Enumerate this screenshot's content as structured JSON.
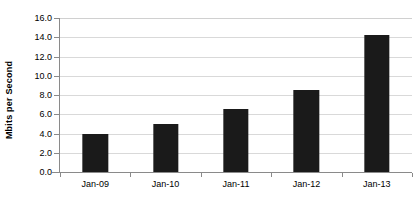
{
  "chart_data": {
    "type": "bar",
    "title": "",
    "xlabel": "",
    "ylabel": "Mbits per Second",
    "categories": [
      "Jan-09",
      "Jan-10",
      "Jan-11",
      "Jan-12",
      "Jan-13"
    ],
    "values": [
      4.0,
      5.0,
      6.5,
      8.5,
      14.2
    ],
    "ylim": [
      0.0,
      16.0
    ],
    "ytick_labels": [
      "0.0",
      "2.0",
      "4.0",
      "6.0",
      "8.0",
      "10.0",
      "12.0",
      "14.0",
      "16.0"
    ],
    "ytick_values": [
      0.0,
      2.0,
      4.0,
      6.0,
      8.0,
      10.0,
      12.0,
      14.0,
      16.0
    ],
    "grid": true,
    "legend": "none",
    "bar_color": "#1a1a1a",
    "gridline_color": "#d9d9d9",
    "axis_color": "#8a8a8a",
    "background_color": "#ffffff"
  }
}
